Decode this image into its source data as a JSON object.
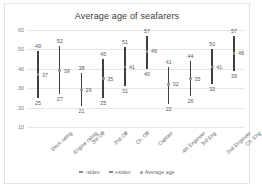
{
  "chart_data": {
    "type": "bar",
    "title": "Average age of seafarers",
    "xlabel": "",
    "ylabel": "",
    "ylim": [
      10,
      60
    ],
    "yticks": [
      60,
      50,
      40,
      30,
      20,
      10
    ],
    "grid": true,
    "legend_position": "bottom",
    "categories": [
      "Deck rating",
      "Engine rating",
      "3rd Off",
      "2nd Off",
      "Ch. Off",
      "Captain",
      "4th Engineer",
      "3rd Eng",
      "2nd Engineer",
      "Ch. Eng"
    ],
    "series": [
      {
        "name": "+stdev",
        "values": [
          49,
          52,
          38,
          45,
          51,
          57,
          41,
          44,
          50,
          57
        ]
      },
      {
        "name": "Average age",
        "values": [
          37,
          39,
          29,
          35,
          41,
          49,
          32,
          35,
          41,
          48
        ]
      },
      {
        "name": "-stdev",
        "values": [
          25,
          27,
          21,
          25,
          31,
          40,
          22,
          26,
          32,
          39
        ]
      }
    ]
  },
  "legend": {
    "items": [
      {
        "label": "-stdev"
      },
      {
        "label": "+stdev"
      },
      {
        "label": "Average age"
      }
    ]
  }
}
